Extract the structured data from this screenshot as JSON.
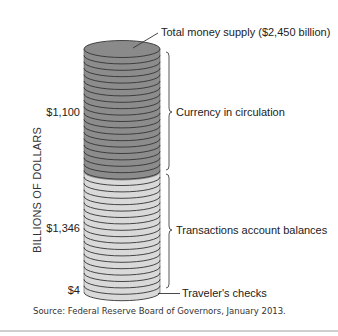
{
  "chart_data": {
    "type": "stacked-coin-column",
    "title": "Total money supply ($2,450 billion)",
    "ylabel": "BILLIONS OF DOLLARS",
    "unit": "billions of dollars",
    "total": 2450,
    "segments": [
      {
        "name": "Currency in circulation",
        "value": 1100,
        "value_label": "$1,100",
        "color": "#8c8c8c"
      },
      {
        "name": "Transactions account balances",
        "value": 1346,
        "value_label": "$1,346",
        "color": "#d9d9d9"
      },
      {
        "name": "Traveler's checks",
        "value": 4,
        "value_label": "$4",
        "color": "#d9d9d9"
      }
    ],
    "source": "Source: Federal Reserve Board of Governors, January 2013."
  },
  "labels": {
    "total": "Total money supply ($2,450 billion)",
    "currency": "Currency in circulation",
    "transactions": "Transactions account balances",
    "travelers": "Traveler's checks",
    "axis": "BILLIONS OF DOLLARS",
    "source": "Source: Federal Reserve Board of Governors, January 2013."
  },
  "values": {
    "currency": "$1,100",
    "transactions": "$1,346",
    "travelers": "$4"
  },
  "colors": {
    "dark_coin": "#8c8c8c",
    "dark_top": "#8a8a8a",
    "light_coin": "#d9d9d9",
    "coin_edge": "#333333",
    "rule": "#cfcfcf"
  }
}
